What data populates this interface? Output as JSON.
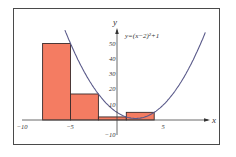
{
  "chart_data": {
    "type": "bar",
    "title": "",
    "equation_label": "y=(x−2)²+1",
    "xlabel": "x",
    "ylabel": "y",
    "xlim": [
      -10,
      10
    ],
    "ylim": [
      -10,
      60
    ],
    "x_ticks": [
      -10,
      -5,
      5
    ],
    "x_tick_labels": [
      "−10",
      "−5",
      "5"
    ],
    "y_ticks": [
      -10,
      10,
      20,
      30,
      40,
      50
    ],
    "y_tick_labels": [
      "−10",
      "10",
      "20",
      "30",
      "40",
      "50"
    ],
    "grid": false,
    "function": "(x-2)^2+1",
    "bars": [
      {
        "x0": -8,
        "x1": -5,
        "height": 50
      },
      {
        "x0": -5,
        "x1": -2,
        "height": 17
      },
      {
        "x0": -2,
        "x1": 1,
        "height": 2
      },
      {
        "x0": 1,
        "x1": 4,
        "height": 5
      }
    ],
    "bar_color": "#f47c62",
    "bar_edge_color": "#3a2a2a",
    "curve_color": "#5a5a8a"
  }
}
